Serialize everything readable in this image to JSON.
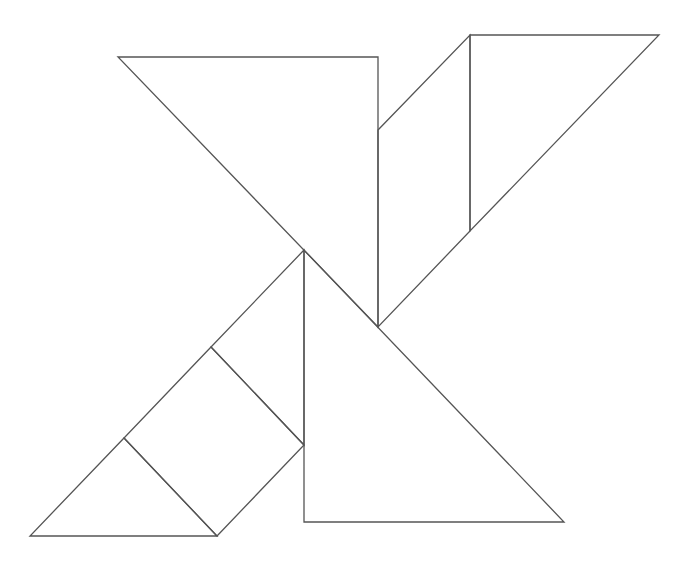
{
  "stroke_color": "#555555",
  "background": "#ffffff",
  "pieces": [
    {
      "name": "large-triangle-top",
      "shape": "triangle",
      "points": [
        [
          118,
          57
        ],
        [
          378,
          57
        ],
        [
          378,
          327
        ]
      ]
    },
    {
      "name": "parallelogram",
      "shape": "parallelogram",
      "points": [
        [
          378,
          130
        ],
        [
          470,
          35
        ],
        [
          470,
          231
        ],
        [
          378,
          327
        ]
      ]
    },
    {
      "name": "medium-triangle-top-right",
      "shape": "triangle",
      "points": [
        [
          470,
          35
        ],
        [
          659,
          35
        ],
        [
          470,
          231
        ]
      ]
    },
    {
      "name": "large-triangle-bottom",
      "shape": "triangle",
      "points": [
        [
          304,
          250
        ],
        [
          304,
          522
        ],
        [
          564,
          522
        ]
      ]
    },
    {
      "name": "medium-upper-left-strip",
      "shape": "triangle",
      "points": [
        [
          304,
          250
        ],
        [
          211,
          347
        ],
        [
          304,
          445
        ]
      ]
    },
    {
      "name": "square",
      "shape": "square",
      "points": [
        [
          211,
          347
        ],
        [
          304,
          445
        ],
        [
          217,
          536
        ],
        [
          124,
          438
        ]
      ]
    },
    {
      "name": "small-triangle-bottom-left",
      "shape": "triangle",
      "points": [
        [
          124,
          438
        ],
        [
          217,
          536
        ],
        [
          30,
          536
        ]
      ]
    }
  ]
}
